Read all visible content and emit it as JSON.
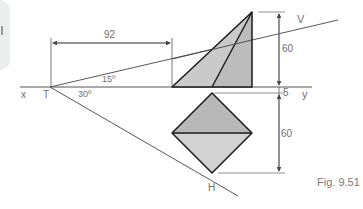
{
  "figure": {
    "caption": "Fig. 9.51",
    "labels": {
      "x": "x",
      "y": "y",
      "T": "T",
      "V": "V",
      "H": "H"
    },
    "angles": {
      "vt_angle": "15º",
      "ht_angle": "30º"
    },
    "dimensions": {
      "horizontal": "92",
      "height_front": "60",
      "gap_above_xy": "5",
      "height_top": "60"
    },
    "colors": {
      "fill_front_left": "#c9c9c9",
      "fill_front_right": "#bdbdbd",
      "fill_top_upper": "#b9b9b9",
      "fill_top_lower": "#d4d4d4",
      "outline": "#1a1a1a",
      "construction": "#555555",
      "dimension_text": "#6f6f6f"
    }
  }
}
